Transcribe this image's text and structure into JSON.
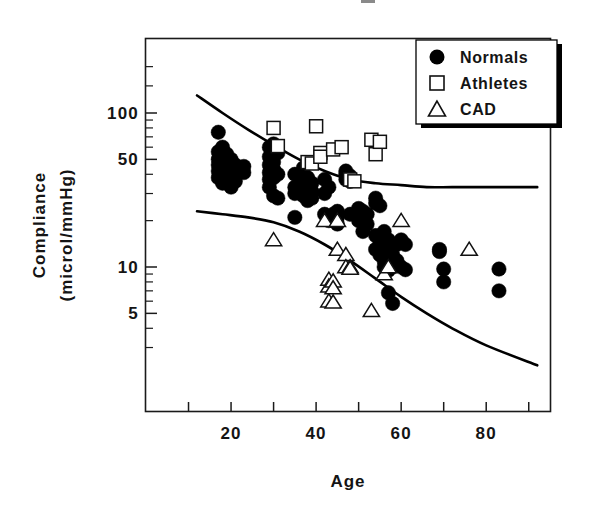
{
  "figure": {
    "background": "#ffffff",
    "ink_color": "#000000"
  },
  "axes": {
    "x_title": "Age",
    "y_title_line1": "Compliance",
    "y_title_line2": "(microl/mmHg)",
    "x_ticks": [
      "20",
      "40",
      "60",
      "80"
    ],
    "y_ticks": [
      "100",
      "50",
      "10",
      "5"
    ]
  },
  "legend": {
    "items": [
      {
        "label": "Normals",
        "marker": "filled-circle-icon"
      },
      {
        "label": "Athletes",
        "marker": "open-square-icon"
      },
      {
        "label": "CAD",
        "marker": "open-triangle-icon"
      }
    ]
  },
  "chart_data": {
    "type": "scatter",
    "title": "",
    "xlabel": "Age",
    "ylabel": "Compliance (microl/mmHg)",
    "xlim": [
      0,
      95
    ],
    "ylim": [
      2,
      200
    ],
    "yscale": "log",
    "xscale": "linear",
    "grid": false,
    "legend_position": "top-right",
    "xticks": [
      10,
      20,
      30,
      40,
      50,
      60,
      70,
      80,
      90
    ],
    "xticklabels": {
      "20": "20",
      "40": "40",
      "60": "60",
      "80": "80"
    },
    "yticks": [
      5,
      10,
      50,
      100
    ],
    "yticklabels": {
      "5": "5",
      "10": "10",
      "50": "50",
      "100": "100"
    },
    "y_minor_ticks": [
      3,
      4,
      6,
      7,
      8,
      9,
      20,
      30,
      40,
      60,
      70,
      80,
      90,
      150,
      200
    ],
    "series": [
      {
        "name": "Normals",
        "marker": "filled-circle",
        "color": "#000000",
        "points": [
          [
            17,
            75
          ],
          [
            17,
            56
          ],
          [
            17,
            50
          ],
          [
            17,
            46
          ],
          [
            17,
            42
          ],
          [
            17,
            38
          ],
          [
            18,
            60
          ],
          [
            18,
            52
          ],
          [
            18,
            47
          ],
          [
            18,
            43
          ],
          [
            18,
            40
          ],
          [
            18,
            35
          ],
          [
            19,
            54
          ],
          [
            19,
            48
          ],
          [
            19,
            44
          ],
          [
            19,
            39
          ],
          [
            20,
            50
          ],
          [
            20,
            45
          ],
          [
            20,
            41
          ],
          [
            20,
            33
          ],
          [
            21,
            46
          ],
          [
            21,
            36
          ],
          [
            23,
            45
          ],
          [
            23,
            41
          ],
          [
            29,
            60
          ],
          [
            29,
            52
          ],
          [
            29,
            46
          ],
          [
            29,
            41
          ],
          [
            29,
            37
          ],
          [
            29,
            33
          ],
          [
            30,
            63
          ],
          [
            30,
            48
          ],
          [
            30,
            43
          ],
          [
            30,
            38
          ],
          [
            30,
            29
          ],
          [
            31,
            55
          ],
          [
            31,
            40
          ],
          [
            31,
            28
          ],
          [
            35,
            40
          ],
          [
            35,
            33
          ],
          [
            35,
            30
          ],
          [
            35,
            21
          ],
          [
            37,
            44
          ],
          [
            37,
            36
          ],
          [
            37,
            31
          ],
          [
            37,
            29
          ],
          [
            38,
            38
          ],
          [
            38,
            33
          ],
          [
            38,
            30
          ],
          [
            38,
            27
          ],
          [
            39,
            35
          ],
          [
            39,
            31
          ],
          [
            39,
            28
          ],
          [
            42,
            37
          ],
          [
            42,
            30
          ],
          [
            42,
            22
          ],
          [
            43,
            33
          ],
          [
            43,
            21
          ],
          [
            43,
            20
          ],
          [
            44,
            22
          ],
          [
            44,
            20
          ],
          [
            45,
            23
          ],
          [
            45,
            21
          ],
          [
            45,
            19
          ],
          [
            47,
            42
          ],
          [
            47,
            40
          ],
          [
            47,
            37
          ],
          [
            48,
            39
          ],
          [
            48,
            36
          ],
          [
            48,
            22
          ],
          [
            50,
            24
          ],
          [
            50,
            21
          ],
          [
            50,
            20
          ],
          [
            51,
            23
          ],
          [
            51,
            20
          ],
          [
            51,
            17
          ],
          [
            52,
            22
          ],
          [
            52,
            19
          ],
          [
            54,
            28
          ],
          [
            54,
            26
          ],
          [
            54,
            16
          ],
          [
            54,
            13
          ],
          [
            55,
            25
          ],
          [
            55,
            14
          ],
          [
            55,
            12
          ],
          [
            56,
            17
          ],
          [
            56,
            13
          ],
          [
            56,
            11
          ],
          [
            56,
            10
          ],
          [
            57,
            15
          ],
          [
            57,
            11
          ],
          [
            57,
            9.5
          ],
          [
            57,
            6.8
          ],
          [
            58,
            12
          ],
          [
            58,
            10
          ],
          [
            58,
            5.8
          ],
          [
            59,
            14
          ],
          [
            59,
            11
          ],
          [
            60,
            15
          ],
          [
            60,
            10
          ],
          [
            61,
            14
          ],
          [
            61,
            9.6
          ],
          [
            69,
            13
          ],
          [
            69,
            12.6
          ],
          [
            70,
            9.7
          ],
          [
            70,
            8.0
          ],
          [
            83,
            9.7
          ],
          [
            83,
            7.0
          ]
        ]
      },
      {
        "name": "Athletes",
        "marker": "open-square",
        "color": "#ffffff",
        "points": [
          [
            30,
            80
          ],
          [
            31,
            61
          ],
          [
            38,
            48
          ],
          [
            39,
            47
          ],
          [
            40,
            82
          ],
          [
            41,
            55
          ],
          [
            41,
            52
          ],
          [
            44,
            58
          ],
          [
            46,
            60
          ],
          [
            48,
            37
          ],
          [
            49,
            36
          ],
          [
            53,
            67
          ],
          [
            54,
            54
          ],
          [
            55,
            65
          ]
        ]
      },
      {
        "name": "CAD",
        "marker": "open-triangle",
        "color": "#ffffff",
        "points": [
          [
            30,
            15
          ],
          [
            42,
            20
          ],
          [
            43,
            8.3
          ],
          [
            43,
            7.5
          ],
          [
            43,
            6.0
          ],
          [
            44,
            8.1
          ],
          [
            44,
            7.3
          ],
          [
            44,
            5.9
          ],
          [
            45,
            13
          ],
          [
            45,
            20
          ],
          [
            47,
            12
          ],
          [
            47,
            10
          ],
          [
            48,
            10
          ],
          [
            48,
            9.8
          ],
          [
            53,
            5.2
          ],
          [
            56,
            9.0
          ],
          [
            57,
            10
          ],
          [
            60,
            20
          ],
          [
            76,
            13
          ]
        ]
      }
    ],
    "annotations": [
      {
        "name": "upper-normal-limit-curve",
        "type": "curve",
        "points": [
          [
            12,
            130
          ],
          [
            18,
            100
          ],
          [
            24,
            78
          ],
          [
            30,
            62
          ],
          [
            36,
            50
          ],
          [
            42,
            42
          ],
          [
            48,
            37
          ],
          [
            54,
            35
          ],
          [
            60,
            34
          ],
          [
            66,
            33
          ],
          [
            72,
            33
          ],
          [
            80,
            33
          ],
          [
            92,
            33
          ]
        ]
      },
      {
        "name": "lower-normal-limit-curve",
        "type": "curve",
        "points": [
          [
            12,
            23
          ],
          [
            18,
            22
          ],
          [
            24,
            21
          ],
          [
            30,
            19.5
          ],
          [
            36,
            17
          ],
          [
            42,
            14
          ],
          [
            48,
            11
          ],
          [
            54,
            8.4
          ],
          [
            60,
            6.4
          ],
          [
            66,
            5.0
          ],
          [
            72,
            4.0
          ],
          [
            80,
            3.1
          ],
          [
            92,
            2.3
          ]
        ]
      }
    ]
  }
}
